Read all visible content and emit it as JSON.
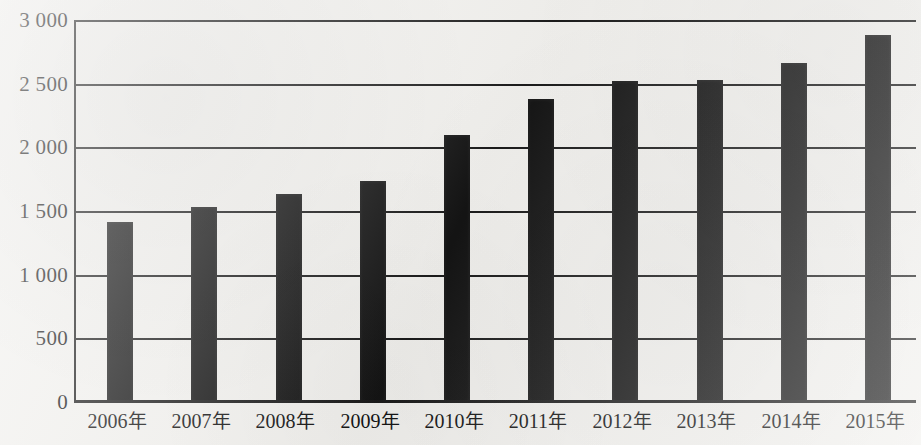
{
  "chart_data": {
    "type": "bar",
    "title": "",
    "subtitle": "",
    "xlabel": "",
    "ylabel": "",
    "categories": [
      "2006年",
      "2007年",
      "2008年",
      "2009年",
      "2010年",
      "2011年",
      "2012年",
      "2013年",
      "2014年",
      "2015年"
    ],
    "values": [
      1420,
      1540,
      1645,
      1740,
      2105,
      2390,
      2530,
      2535,
      2670,
      2890
    ],
    "series": [
      {
        "name": "",
        "values": [
          1420,
          1540,
          1645,
          1740,
          2105,
          2390,
          2530,
          2535,
          2670,
          2890
        ]
      }
    ],
    "ylim": [
      0,
      3000
    ],
    "y_ticks": [
      0,
      500,
      1000,
      1500,
      2000,
      2500,
      3000
    ],
    "y_tick_labels": [
      "0",
      "500",
      "1 000",
      "1 500",
      "2 000",
      "2 500",
      "3 000"
    ],
    "grid": true,
    "grid_axis": "y",
    "legend": false,
    "legend_position": "none",
    "bar_color": "#141414",
    "background_color": "#f2f1ee",
    "axis_color": "#1b1b1b"
  },
  "axes": {
    "y_ticks": [
      {
        "label": "3 000",
        "value": 3000
      },
      {
        "label": "2 500",
        "value": 2500
      },
      {
        "label": "2 000",
        "value": 2000
      },
      {
        "label": "1 500",
        "value": 1500
      },
      {
        "label": "1 000",
        "value": 1000
      },
      {
        "label": "500",
        "value": 500
      },
      {
        "label": "0",
        "value": 0
      }
    ],
    "x_ticks": [
      {
        "year": "2006",
        "suffix": "年"
      },
      {
        "year": "2007",
        "suffix": "年"
      },
      {
        "year": "2008",
        "suffix": "年"
      },
      {
        "year": "2009",
        "suffix": "年"
      },
      {
        "year": "2010",
        "suffix": "年"
      },
      {
        "year": "2011",
        "suffix": "年"
      },
      {
        "year": "2012",
        "suffix": "年"
      },
      {
        "year": "2013",
        "suffix": "年"
      },
      {
        "year": "2014",
        "suffix": "年"
      },
      {
        "year": "2015",
        "suffix": "年"
      }
    ]
  }
}
